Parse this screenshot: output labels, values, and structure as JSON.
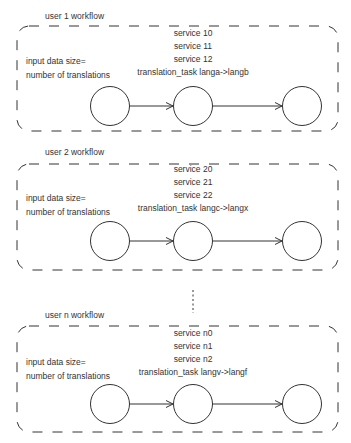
{
  "workflows": [
    {
      "title": "user 1 workflow",
      "input_label_line1": "input data size=",
      "input_label_line2": "number of translations",
      "services": [
        "service 10",
        "service 11",
        "service 12"
      ],
      "task": "translation_task langa->langb"
    },
    {
      "title": "user 2 workflow",
      "input_label_line1": "input data size=",
      "input_label_line2": "number of translations",
      "services": [
        "service 20",
        "service 21",
        "service 22"
      ],
      "task": "translation_task langc->langx"
    },
    {
      "title": "user n workflow",
      "input_label_line1": "input data size=",
      "input_label_line2": "number of translations",
      "services": [
        "service n0",
        "service n1",
        "service n2"
      ],
      "task": "translation_task langv->langf"
    }
  ],
  "colors": {
    "stroke": "#333333",
    "background": "#ffffff"
  }
}
